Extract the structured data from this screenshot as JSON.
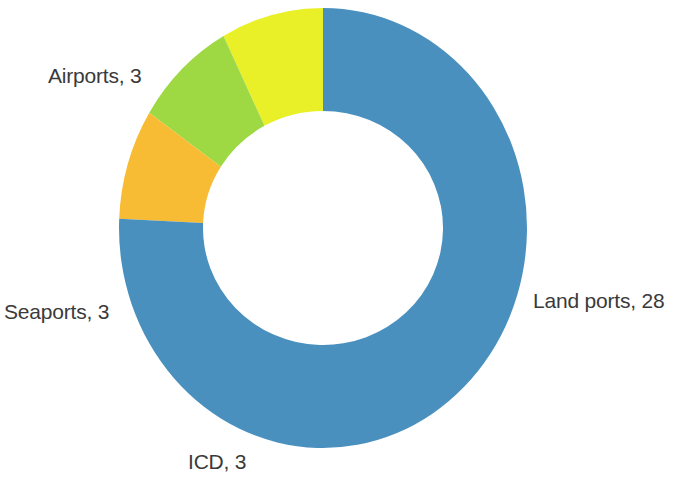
{
  "chart_data": {
    "type": "pie",
    "variant": "donut",
    "title": "",
    "subtitle": "",
    "xlabel": "",
    "ylabel": "",
    "legend_position": "none",
    "grid": false,
    "label_format": "name, value",
    "total": 37,
    "start_angle_deg": 0,
    "direction": "counterclockwise",
    "categories": [
      "Land ports",
      "Airports",
      "Seaports",
      "ICD"
    ],
    "values": [
      28,
      3,
      3,
      3
    ],
    "colors": [
      "#4a90bf",
      "#e9f028",
      "#9ed944",
      "#f7bc33"
    ],
    "slices": [
      {
        "name": "Land ports",
        "value": 28,
        "percent": 75.7,
        "color": "#4a90bf",
        "label": "Land ports, 28",
        "label_position": "right"
      },
      {
        "name": "Airports",
        "value": 3,
        "percent": 8.1,
        "color": "#e9f028",
        "label": "Airports, 3",
        "label_position": "upper-left"
      },
      {
        "name": "Seaports",
        "value": 3,
        "percent": 8.1,
        "color": "#9ed944",
        "label": "Seaports, 3",
        "label_position": "left"
      },
      {
        "name": "ICD",
        "value": 3,
        "percent": 8.1,
        "color": "#f7bc33",
        "label": "ICD, 3",
        "label_position": "bottom"
      }
    ]
  },
  "labels": {
    "land_ports": "Land ports, 28",
    "airports": "Airports, 3",
    "seaports": "Seaports, 3",
    "icd": "ICD, 3"
  },
  "geometry": {
    "center_x": 323,
    "center_y": 228,
    "outer_rx": 204,
    "outer_ry": 220,
    "inner_rx": 120,
    "inner_ry": 117
  },
  "colors": {
    "background": "#ffffff",
    "text": "#3a3a3a",
    "land_ports": "#4a90bf",
    "airports": "#e9f028",
    "seaports": "#9ed944",
    "icd": "#f7bc33"
  }
}
